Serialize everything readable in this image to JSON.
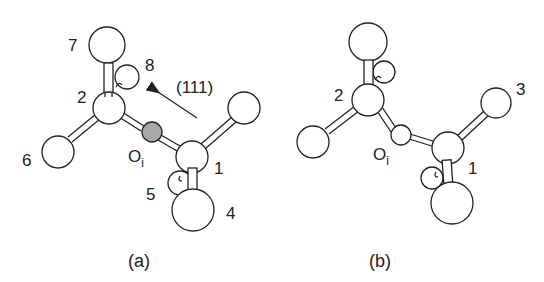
{
  "figure": {
    "panels": [
      {
        "id": "a",
        "caption": "(a)",
        "direction_label": "(111)",
        "atom_labels": {
          "a1": "1",
          "a2": "2",
          "a4": "4",
          "a5": "5",
          "a6": "6",
          "a7": "7",
          "a8": "8",
          "oxygen": "O",
          "oxygen_sub": "i"
        },
        "oxygen_color": "#a8a8a8"
      },
      {
        "id": "b",
        "caption": "(b)",
        "atom_labels": {
          "a1": "1",
          "a2": "2",
          "a3": "3",
          "oxygen": "O",
          "oxygen_sub": "i"
        },
        "oxygen_color": "#ffffff"
      }
    ]
  }
}
